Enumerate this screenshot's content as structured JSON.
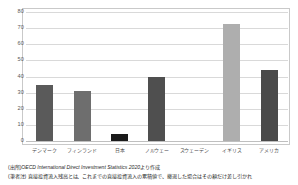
{
  "chart_data": {
    "type": "bar",
    "title": "",
    "xlabel": "",
    "ylabel": "",
    "categories": [
      "デンマーク",
      "フィンランド",
      "日本",
      "ノルウェー",
      "スウェーデン",
      "イギリス",
      "アメリカ"
    ],
    "values": [
      35,
      31,
      4.5,
      40,
      0,
      72.5,
      44
    ],
    "bar_colors": [
      "#5a5a5a",
      "#6e6e6e",
      "#1a1a1a",
      "#4f4f4f",
      "#ffffff",
      "#aeaeae",
      "#4a4a4a"
    ],
    "ylim": [
      0,
      80
    ],
    "yticks": [
      0,
      10,
      20,
      30,
      40,
      50,
      60,
      70,
      80
    ],
    "ytick_labels": [
      "0",
      "10",
      "20",
      "30",
      "40",
      "50",
      "60",
      "70",
      "80"
    ],
    "grid": true,
    "legend": false,
    "legend_position": "none",
    "notes": [
      "(出所)OECD International Direct Investment Statistics 2020より作成",
      "(筆者注) 直接投資流入残高とは、これまでの直接投資流入の累積値で、撤退した場合はその額だけ差し引かれ"
    ],
    "source_prefix": "(出所)",
    "source_italic": "OECD International Direct Investment Statistics 2020",
    "source_suffix": "より作成"
  }
}
